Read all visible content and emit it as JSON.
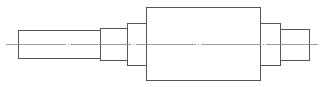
{
  "diagram": {
    "title": "",
    "type": "stepped shaft technical drawing",
    "colors": {
      "background": "#ffffff",
      "outline": "#555555",
      "centerline": "#888888"
    },
    "centerline": {
      "x1": 6,
      "x2": 318,
      "y": 44
    },
    "sections": [
      {
        "name": "left-journal",
        "x1": 18,
        "x2": 100,
        "top": 30,
        "bottom": 58
      },
      {
        "name": "left-shoulder",
        "x1": 100,
        "x2": 127,
        "top": 28,
        "bottom": 60
      },
      {
        "name": "left-collar",
        "x1": 127,
        "x2": 146,
        "top": 23,
        "bottom": 65
      },
      {
        "name": "main-body",
        "x1": 146,
        "x2": 260,
        "top": 7,
        "bottom": 80
      },
      {
        "name": "right-collar",
        "x1": 260,
        "x2": 280,
        "top": 23,
        "bottom": 65
      },
      {
        "name": "right-journal",
        "x1": 280,
        "x2": 309,
        "top": 29,
        "bottom": 60
      }
    ]
  }
}
